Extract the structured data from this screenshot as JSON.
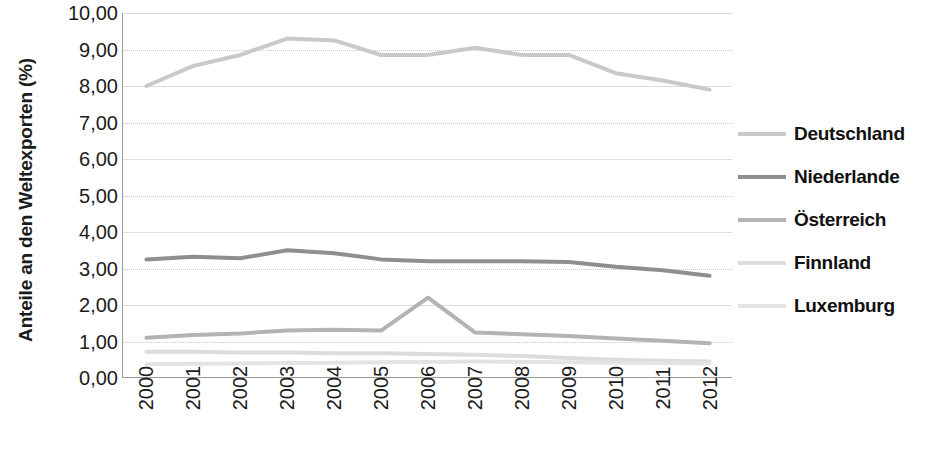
{
  "chart_data": {
    "type": "line",
    "title": "",
    "subtitle": "",
    "xlabel": "",
    "ylabel": "Anteile an den Weltexporten (%)",
    "x": [
      "2000",
      "2001",
      "2002",
      "2003",
      "2004",
      "2005",
      "2006",
      "2007",
      "2008",
      "2009",
      "2010",
      "2011",
      "2012"
    ],
    "ylim": [
      0,
      10
    ],
    "ytick_labels": [
      "0,00",
      "1,00",
      "2,00",
      "3,00",
      "4,00",
      "5,00",
      "6,00",
      "7,00",
      "8,00",
      "9,00",
      "10,00"
    ],
    "ytick_values": [
      0,
      1,
      2,
      3,
      4,
      5,
      6,
      7,
      8,
      9,
      10
    ],
    "grid": "horizontal",
    "legend_position": "right",
    "decimal_separator": ",",
    "series": [
      {
        "name": "Deutschland",
        "color": "#c9c9c9",
        "values": [
          8.0,
          8.55,
          8.85,
          9.3,
          9.25,
          8.85,
          8.85,
          9.05,
          8.85,
          8.85,
          8.35,
          8.15,
          7.9
        ]
      },
      {
        "name": "Niederlande",
        "color": "#8e8e8e",
        "values": [
          3.25,
          3.32,
          3.28,
          3.5,
          3.42,
          3.25,
          3.2,
          3.2,
          3.2,
          3.18,
          3.05,
          2.95,
          2.8
        ]
      },
      {
        "name": "Österreich",
        "color": "#b3b3b3",
        "values": [
          1.1,
          1.18,
          1.22,
          1.3,
          1.32,
          1.3,
          2.2,
          1.25,
          1.2,
          1.15,
          1.08,
          1.02,
          0.95
        ]
      },
      {
        "name": "Finnland",
        "color": "#dcdcdc",
        "values": [
          0.72,
          0.72,
          0.7,
          0.7,
          0.68,
          0.68,
          0.66,
          0.64,
          0.6,
          0.55,
          0.5,
          0.47,
          0.45
        ]
      },
      {
        "name": "Luxemburg",
        "color": "#e3e3e3",
        "values": [
          0.38,
          0.39,
          0.4,
          0.41,
          0.42,
          0.43,
          0.44,
          0.45,
          0.44,
          0.43,
          0.42,
          0.41,
          0.4
        ]
      }
    ]
  }
}
